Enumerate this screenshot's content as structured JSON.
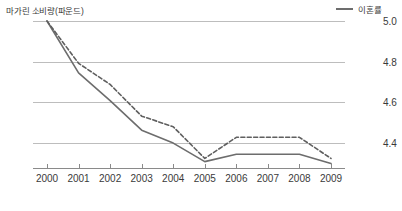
{
  "left_axis_title": "마가린 소비량(파운드)",
  "legend": {
    "label": "이혼률",
    "swatch_name": "legend-line-sample"
  },
  "colors": {
    "solid_line": "#6d6d6d",
    "dashed_line": "#5f5f5f",
    "gridline": "#bdbdbd",
    "axis": "#8a8a8a",
    "text": "#3a3a3a",
    "background": "#ffffff"
  },
  "chart_data": {
    "type": "line",
    "title": "마가린 소비량(파운드)",
    "xlabel": "",
    "ylabel": "마가린 소비량(파운드)",
    "y2label": "이혼률",
    "grid": true,
    "legend_position": "top-right",
    "categories": [
      "2000",
      "2001",
      "2002",
      "2003",
      "2004",
      "2005",
      "2006",
      "2007",
      "2008",
      "2009"
    ],
    "x": [
      2000,
      2001,
      2002,
      2003,
      2004,
      2005,
      2006,
      2007,
      2008,
      2009
    ],
    "yticks_left": [
      "8.2",
      "7.1",
      "6.0",
      "4.9"
    ],
    "yticks_left_values": [
      8.2,
      7.1,
      6.0,
      4.9
    ],
    "yticks_right": [
      "5.0",
      "4.8",
      "4.6",
      "4.4"
    ],
    "yticks_right_values": [
      5.0,
      4.8,
      4.6,
      4.4
    ],
    "ylim": [
      4.2,
      8.2
    ],
    "y2lim": [
      4.3,
      5.0
    ],
    "series": [
      {
        "name": "마가린 소비량(파운드)",
        "axis": "left",
        "style": "solid",
        "color": "#6d6d6d",
        "values": [
          8.2,
          6.8,
          6.05,
          5.25,
          4.9,
          4.4,
          4.6,
          4.6,
          4.6,
          4.35
        ]
      },
      {
        "name": "이혼률",
        "axis": "right",
        "style": "dashed",
        "color": "#5f5f5f",
        "values": [
          5.0,
          4.8,
          4.7,
          4.55,
          4.5,
          4.35,
          4.45,
          4.45,
          4.45,
          4.35
        ]
      }
    ]
  }
}
